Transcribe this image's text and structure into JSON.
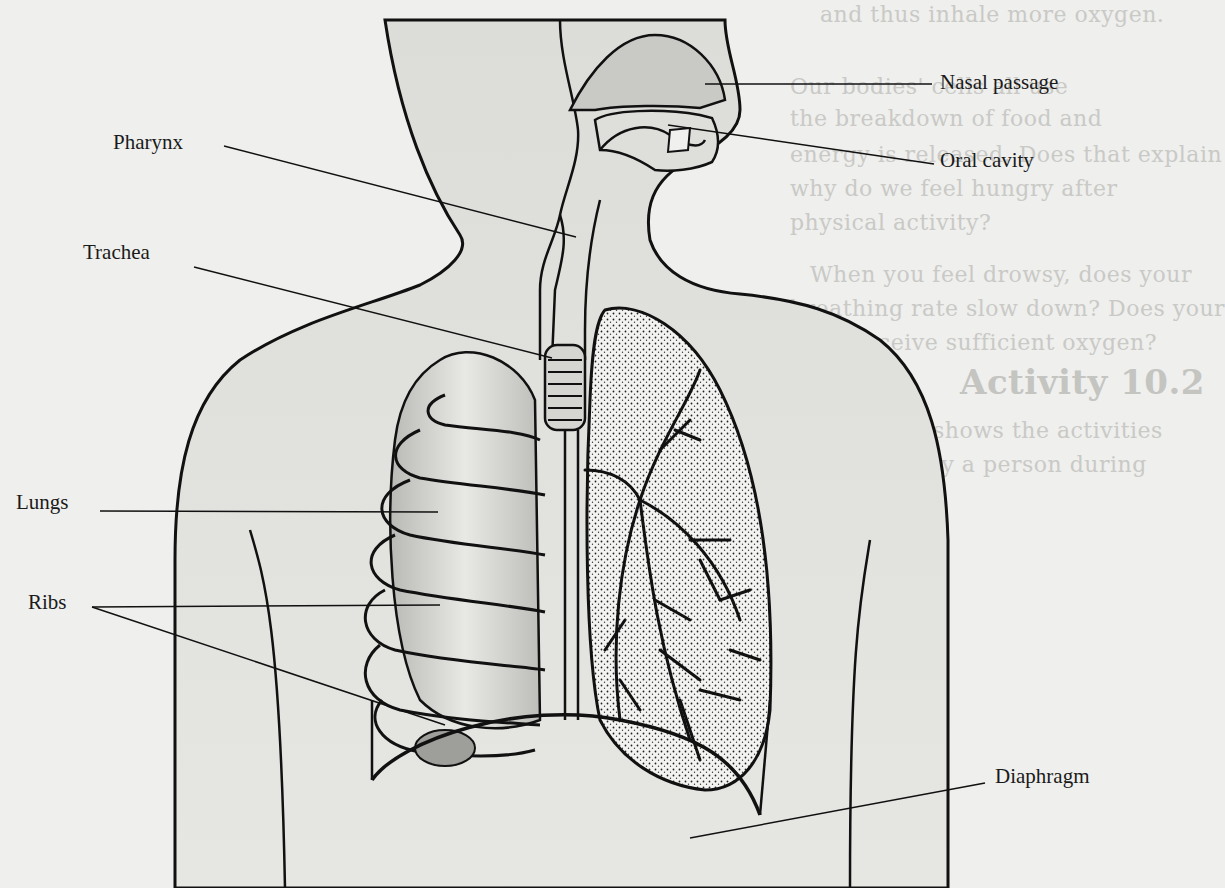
{
  "figure": {
    "labels": [
      {
        "id": "nasal-passage",
        "text": "Nasal passage"
      },
      {
        "id": "oral-cavity",
        "text": "Oral cavity"
      },
      {
        "id": "pharynx",
        "text": "Pharynx"
      },
      {
        "id": "trachea",
        "text": "Trachea"
      },
      {
        "id": "lungs",
        "text": "Lungs"
      },
      {
        "id": "ribs",
        "text": "Ribs"
      },
      {
        "id": "diaphragm",
        "text": "Diaphragm"
      }
    ]
  },
  "background_page_text": {
    "lines": [
      "and thus inhale more oxygen.",
      "Our bodies' cells all use",
      "the breakdown of food and",
      "energy is released. Does that explain",
      "why do we feel hungry after",
      "physical activity?",
      "When you feel drowsy, does your",
      "breathing rate slow down? Does your",
      "body receive sufficient oxygen?",
      "Activity 10.2",
      "Figure 10.8 shows the activities",
      "carried out by a person during"
    ],
    "right_column": [
      "the activity in which you",
      "breathing will be the slowest",
      "in which will be the fastest. Assign",
      "numbers to the picture in the order",
      "increasing rate of breathing according",
      "to your experience.",
      "Let us now learn about the mechanism",
      "of breathing. Normally we take in",
      "air through our nostrils. When we inhale,",
      "it passes through our nostrils into",
      "the nasal cavity. From the nasal cavity",
      "air reaches our lungs through",
      "the windpipe. Lungs are present in",
      "the chest cavity. This cavity",
      "is surrounded by ribs on the sides. A large",
      "muscular sheet called diaphragm forms",
      "the floor of the chest cavity (Fig. 10",
      "Breathing involves the movement of",
      "diaphragm and the rib cage.",
      "During inhalation, ribs move up and"
    ]
  }
}
